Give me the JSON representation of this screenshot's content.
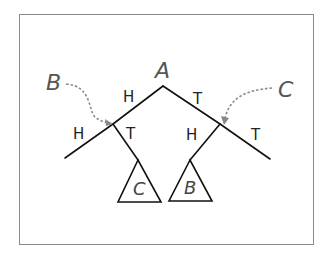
{
  "diagram": {
    "type": "game-tree",
    "root": {
      "label": "A"
    },
    "edges": [
      {
        "from": "A",
        "to": "left-node",
        "label": "H"
      },
      {
        "from": "A",
        "to": "right-node",
        "label": "T"
      },
      {
        "from": "left-node",
        "to": "left-leaf",
        "label": "H"
      },
      {
        "from": "left-node",
        "to": "subtree-C",
        "label": "T"
      },
      {
        "from": "right-node",
        "to": "subtree-B",
        "label": "H"
      },
      {
        "from": "right-node",
        "to": "right-leaf",
        "label": "T"
      }
    ],
    "annotations": [
      {
        "label": "B",
        "points_to": "left-node",
        "style": "dashed-arrow"
      },
      {
        "label": "C",
        "points_to": "right-node",
        "style": "dashed-arrow"
      }
    ],
    "subtrees": [
      {
        "label": "C",
        "position": "under-left-node-T"
      },
      {
        "label": "B",
        "position": "under-right-node-H"
      }
    ],
    "colors": {
      "lines": "#111111",
      "arrows": "#888888",
      "frame": "#8a8a8a"
    }
  },
  "labels": {
    "root": "A",
    "callout_left": "B",
    "callout_right": "C",
    "edge_root_left": "H",
    "edge_root_right": "T",
    "edge_left_left": "H",
    "edge_left_right": "T",
    "edge_right_left": "H",
    "edge_right_right": "T",
    "subtree_left": "C",
    "subtree_right": "B"
  }
}
